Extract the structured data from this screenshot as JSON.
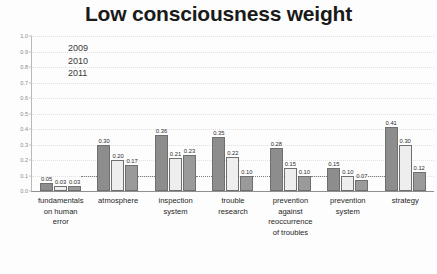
{
  "chart_data": {
    "type": "bar",
    "title": "Low consciousness weight",
    "xlabel": "",
    "ylabel": "",
    "ylim": [
      0.0,
      1.0
    ],
    "grid": true,
    "legend_position": "upper-left-inside",
    "y_ticks": [
      "1.0",
      "0.9",
      "0.8",
      "0.7",
      "0.6",
      "0.5",
      "0.4",
      "0.3",
      "0.2",
      "0.1",
      "0.0"
    ],
    "y_tick_values": [
      1.0,
      0.9,
      0.8,
      0.7,
      0.6,
      0.5,
      0.4,
      0.3,
      0.2,
      0.1,
      0.0
    ],
    "categories": [
      "fundamentals on human error",
      "atmosphere",
      "inspection system",
      "trouble research",
      "prevention against reoccurrence of troubles",
      "prevention system",
      "strategy"
    ],
    "category_lines": [
      [
        "fundamentals",
        "on human",
        "error"
      ],
      [
        "atmosphere"
      ],
      [
        "inspection",
        "system"
      ],
      [
        "trouble",
        "research"
      ],
      [
        "prevention",
        "against",
        "reoccurrence",
        "of troubles"
      ],
      [
        "prevention",
        "system"
      ],
      [
        "strategy"
      ]
    ],
    "series": [
      {
        "name": "2009",
        "color": "#8d8d8d",
        "values": [
          0.05,
          0.3,
          0.36,
          0.35,
          0.28,
          0.15,
          0.41
        ],
        "labels": [
          "0.05",
          "0.30",
          "0.36",
          "0.35",
          "0.28",
          "0.15",
          "0.41"
        ]
      },
      {
        "name": "2010",
        "color": "#eeeeee",
        "values": [
          0.03,
          0.2,
          0.21,
          0.22,
          0.15,
          0.1,
          0.3
        ],
        "labels": [
          "0.03",
          "0.20",
          "0.21",
          "0.22",
          "0.15",
          "0.10",
          "0.30"
        ]
      },
      {
        "name": "2011",
        "color": "#9a9a9a",
        "values": [
          0.03,
          0.17,
          0.23,
          0.1,
          0.1,
          0.07,
          0.12
        ],
        "labels": [
          "0.03",
          "0.17",
          "0.23",
          "0.10",
          "0.10",
          "0.07",
          "0.12"
        ]
      }
    ],
    "reference_line": {
      "label": "",
      "style": "dotted",
      "color": "#7d7d7d",
      "value": 0.1
    }
  },
  "legend": {
    "items": [
      {
        "label": "2009"
      },
      {
        "label": "2010"
      },
      {
        "label": "2011"
      }
    ]
  }
}
